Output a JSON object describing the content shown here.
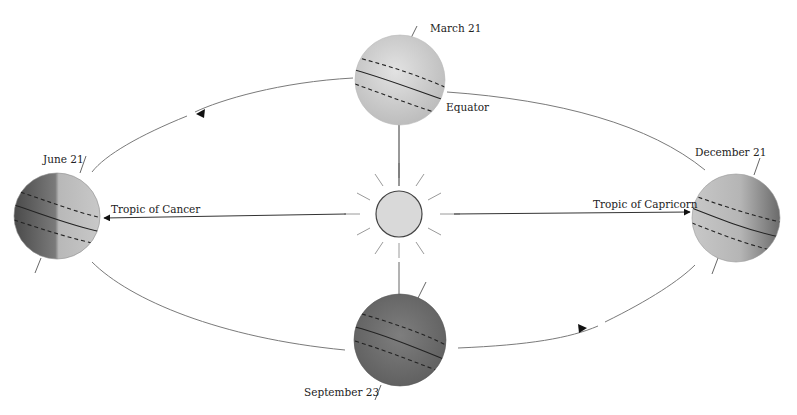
{
  "diagram": {
    "labels": {
      "march": "March 21",
      "june": "June 21",
      "september": "September 23",
      "december": "December 21",
      "equator": "Equator",
      "tropic_cancer": "Tropic of Cancer",
      "tropic_capricorn": "Tropic of Capricorn"
    },
    "nodes": [
      {
        "id": "sun",
        "label": "",
        "shape": "circle with rays"
      },
      {
        "id": "earth-march",
        "label": "March 21"
      },
      {
        "id": "earth-june",
        "label": "June 21"
      },
      {
        "id": "earth-september",
        "label": "September 23"
      },
      {
        "id": "earth-december",
        "label": "December 21"
      }
    ],
    "edges": [
      {
        "from": "sun",
        "to": "earth-march",
        "type": "arrow",
        "label": "Equator"
      },
      {
        "from": "sun",
        "to": "earth-june",
        "type": "arrow",
        "label": "Tropic of Cancer"
      },
      {
        "from": "sun",
        "to": "earth-december",
        "type": "arrow",
        "label": "Tropic of Capricorn"
      },
      {
        "from": "sun",
        "to": "earth-september",
        "type": "line",
        "label": ""
      }
    ],
    "orbit_direction": "counter-clockwise",
    "colors": {
      "sun_fill": "#d8d8d8",
      "earth_light": "#c8c8c8",
      "earth_dark": "#6e6e6e",
      "line": "#222222"
    }
  }
}
